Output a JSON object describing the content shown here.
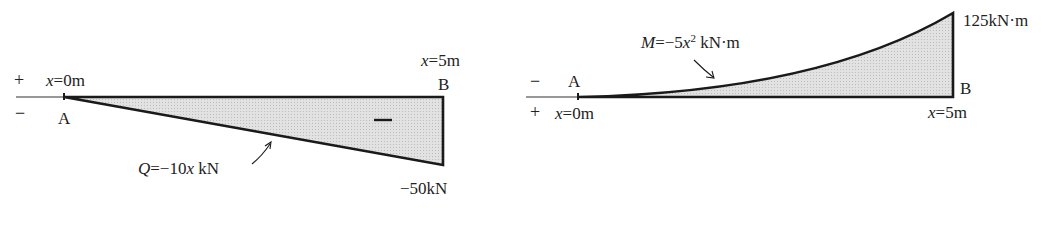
{
  "shear_diagram": {
    "sign_positive": "+",
    "sign_negative": "−",
    "left_x_var": "x",
    "left_x_value": "=0m",
    "right_x_var": "x",
    "right_x_value": "=5m",
    "point_a": "A",
    "point_b": "B",
    "region_sign": "−",
    "equation_var": "Q",
    "equation_mid": "=−10",
    "equation_x": "x",
    "equation_unit": " kN",
    "end_value": "−50kN"
  },
  "moment_diagram": {
    "sign_negative": "−",
    "sign_positive": "+",
    "left_x_var": "x",
    "left_x_value": "=0m",
    "right_x_var": "x",
    "right_x_value": "=5m",
    "point_a": "A",
    "point_b": "B",
    "equation_var": "M",
    "equation_mid": "=−5",
    "equation_x": "x",
    "equation_exp": "2",
    "equation_unit": " kN·m",
    "end_value": "125kN·m"
  },
  "colors": {
    "line": "#1a1a1a",
    "fill": "#dcdcdc",
    "text": "#222222"
  }
}
